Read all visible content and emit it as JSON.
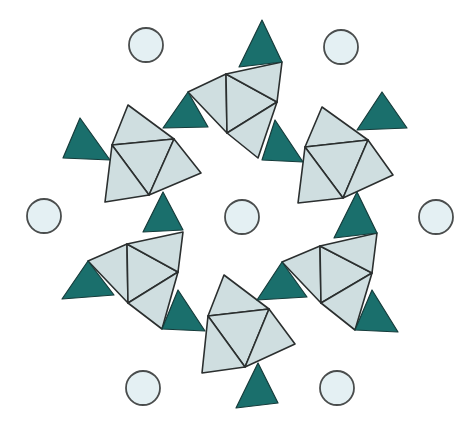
{
  "diagram": {
    "title": "",
    "colors": {
      "octahedron_fill": "#cfdee0",
      "tetrahedron_fill": "#1a6f6c",
      "ion_fill": "#e4f0f3",
      "edge": "#2b2f2f",
      "background": "#ffffff"
    },
    "ions": [
      {
        "cx": 146,
        "cy": 45,
        "r": 17
      },
      {
        "cx": 341,
        "cy": 47,
        "r": 17
      },
      {
        "cx": 44,
        "cy": 216,
        "r": 17
      },
      {
        "cx": 242,
        "cy": 217,
        "r": 17
      },
      {
        "cx": 436,
        "cy": 217,
        "r": 17
      },
      {
        "cx": 143,
        "cy": 388,
        "r": 17
      },
      {
        "cx": 337,
        "cy": 388,
        "r": 17
      }
    ],
    "tetrahedra": [
      {
        "points": "262,20 239,67 282,62"
      },
      {
        "points": "188,92 163,128 208,127"
      },
      {
        "points": "275,120 262,160 303,162"
      },
      {
        "points": "80,118 63,158 110,160"
      },
      {
        "points": "382,92 357,130 407,128"
      },
      {
        "points": "163,192 143,232 183,230"
      },
      {
        "points": "357,192 334,238 377,233"
      },
      {
        "points": "88,261 62,299 114,295"
      },
      {
        "points": "178,290 162,329 205,331"
      },
      {
        "points": "282,262 257,300 307,297"
      },
      {
        "points": "372,290 355,330 398,332"
      },
      {
        "points": "258,363 236,408 278,403"
      }
    ],
    "octahedra_clusters": [
      {
        "name": "top",
        "faces": [
          "188,92 226,74 227,133",
          "226,74 277,102 227,133",
          "226,74 282,62 277,102",
          "227,133 277,102 258,158"
        ]
      },
      {
        "name": "left",
        "faces": [
          "128,105 112,145 174,139",
          "112,145 174,139 149,195",
          "112,145 149,195 105,202",
          "174,139 201,173 149,195"
        ]
      },
      {
        "name": "right",
        "faces": [
          "322,107 305,147 368,140",
          "305,147 368,140 343,198",
          "305,147 343,198 298,203",
          "368,140 393,175 343,198"
        ]
      },
      {
        "name": "bottom-left",
        "faces": [
          "88,261 127,244 128,303",
          "127,244 178,272 128,303",
          "127,244 183,232 178,272",
          "128,303 178,272 162,329"
        ]
      },
      {
        "name": "bottom-right",
        "faces": [
          "282,262 320,246 321,303",
          "320,246 372,273 321,303",
          "320,246 377,233 372,273",
          "321,303 372,273 355,330"
        ]
      },
      {
        "name": "bottom-middle",
        "faces": [
          "224,275 208,316 269,309",
          "208,316 269,309 245,367",
          "208,316 245,367 202,373",
          "269,309 295,344 245,367"
        ]
      }
    ]
  }
}
